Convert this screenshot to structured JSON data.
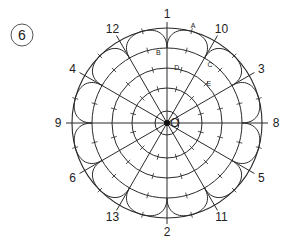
{
  "figure": {
    "badge_number": "6",
    "center_label": "O",
    "colors": {
      "stroke": "#2a2a2a",
      "background": "#ffffff",
      "text": "#222222"
    }
  },
  "geometry": {
    "center": [
      167,
      123
    ],
    "outer_radius": 95,
    "ring_radii": [
      75,
      55,
      35,
      12
    ],
    "ray_overshoot": 6,
    "ray_count": 12
  },
  "rays": [
    {
      "angle": 0,
      "label": "1"
    },
    {
      "angle": 30,
      "label": "10"
    },
    {
      "angle": 60,
      "label": "3"
    },
    {
      "angle": 90,
      "label": "8"
    },
    {
      "angle": 120,
      "label": "5"
    },
    {
      "angle": 150,
      "label": "11"
    },
    {
      "angle": 180,
      "label": "2"
    },
    {
      "angle": 210,
      "label": "13"
    },
    {
      "angle": 240,
      "label": "6"
    },
    {
      "angle": 270,
      "label": "9"
    },
    {
      "angle": 300,
      "label": "4"
    },
    {
      "angle": 330,
      "label": "12"
    }
  ],
  "points": [
    {
      "label": "A",
      "angle": 15,
      "radius": 101
    },
    {
      "label": "B",
      "angle": -7,
      "radius": 72
    },
    {
      "label": "C",
      "angle": 36,
      "radius": 73
    },
    {
      "label": "D",
      "angle": 10,
      "radius": 57
    },
    {
      "label": "E",
      "angle": 46,
      "radius": 58
    }
  ]
}
